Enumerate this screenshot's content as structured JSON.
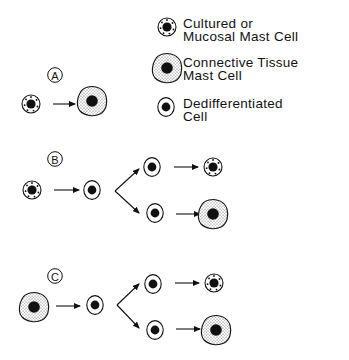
{
  "legend": {
    "items": [
      {
        "icon": "mucosal-mast-cell-icon",
        "line1": "Cultured or",
        "line2": "Mucosal Mast Cell"
      },
      {
        "icon": "connective-tissue-mast-cell-icon",
        "line1": "Connective Tissue",
        "line2": "Mast Cell"
      },
      {
        "icon": "dedifferentiated-cell-icon",
        "line1": "Dedifferentiated",
        "line2": "Cell"
      }
    ]
  },
  "panels": [
    {
      "label": "A",
      "sequence": [
        "Cultured or Mucosal Mast Cell",
        "Connective Tissue Mast Cell"
      ]
    },
    {
      "label": "B",
      "sequence": [
        "Cultured or Mucosal Mast Cell",
        "Dedifferentiated Cell",
        [
          "Dedifferentiated Cell -> Cultured or Mucosal Mast Cell",
          "Dedifferentiated Cell -> Connective Tissue Mast Cell"
        ]
      ]
    },
    {
      "label": "C",
      "sequence": [
        "Connective Tissue Mast Cell",
        "Dedifferentiated Cell",
        [
          "Dedifferentiated Cell -> Cultured or Mucosal Mast Cell",
          "Dedifferentiated Cell -> Connective Tissue Mast Cell"
        ]
      ]
    }
  ]
}
